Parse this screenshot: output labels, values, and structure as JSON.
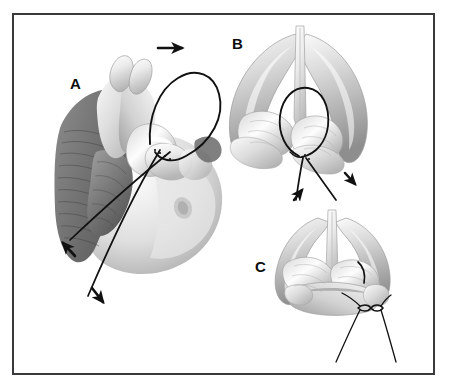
{
  "figure": {
    "background_color": "#ffffff",
    "border_color": "#3a3a3c",
    "ink_color": "#111111",
    "cartilage_light": "#f2f2f2",
    "cartilage_mid": "#bfbfbf",
    "cartilage_dark": "#8a8a8a",
    "tissue_dark": "#6e6e6e"
  },
  "panels": [
    {
      "id": "A",
      "label": "A",
      "caption": "Oblique view of face with nasal musculature exposed; suture loop passed through nasal tip cartilage",
      "view": "oblique-lateral",
      "elements": [
        "facial-soft-tissue",
        "nasalis-muscle-striations",
        "lower-lateral-cartilage",
        "suture-loop",
        "suture-tail-superior",
        "suture-tail-inferior"
      ],
      "arrows": [
        {
          "name": "loop-direction-arrow",
          "direction": "right",
          "position": "top-of-loop"
        },
        {
          "name": "suture-tail-arrow-upper",
          "direction": "up-left",
          "position": "lower-left"
        },
        {
          "name": "suture-tail-arrow-lower",
          "direction": "down-left",
          "position": "bottom-left"
        }
      ]
    },
    {
      "id": "B",
      "label": "B",
      "caption": "Basal view of nasal cartilage framework with suture loop around lateral crus; tails drawn in opposite directions",
      "view": "base",
      "elements": [
        "alar-cartilage-left",
        "alar-cartilage-right",
        "medial-crura-columella",
        "lateral-crus",
        "suture-loop",
        "suture-tail-left",
        "suture-tail-right"
      ],
      "arrows": [
        {
          "name": "suture-tension-arrow-left",
          "direction": "up-left",
          "position": "bottom-left"
        },
        {
          "name": "suture-tension-arrow-right",
          "direction": "down-right",
          "position": "bottom-right"
        }
      ]
    },
    {
      "id": "C",
      "label": "C",
      "caption": "Basal view after suture is tied; knot secured below the cartilage with suture ends crossing",
      "view": "base",
      "elements": [
        "alar-cartilage-left",
        "alar-cartilage-right",
        "medial-crura-columella",
        "completed-stitch",
        "surgical-knot",
        "suture-end-left",
        "suture-end-right"
      ],
      "arrows": []
    }
  ]
}
